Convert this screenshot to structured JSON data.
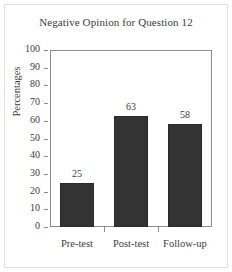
{
  "figure": {
    "background_color": "#ffffff",
    "frame_color": "#e3e3e3"
  },
  "chart_data": {
    "type": "bar",
    "title": "Negative Opinion for Question 12",
    "xlabel": "",
    "ylabel": "Percentages",
    "categories": [
      "Pre-test",
      "Post-test",
      "Follow-up"
    ],
    "values": [
      25,
      63,
      58
    ],
    "data_labels": [
      "25",
      "63",
      "58"
    ],
    "ylim": [
      0,
      100
    ],
    "ytick_step": 10,
    "yticks": [
      100,
      90,
      80,
      70,
      60,
      50,
      40,
      30,
      20,
      10,
      0
    ],
    "ytick_labels": [
      "100",
      "90",
      "80",
      "70",
      "60",
      "50",
      "40",
      "30",
      "20",
      "10",
      "0"
    ],
    "grid": false,
    "legend": null,
    "bar_color": "#333333",
    "axis_color": "#8d8d8d",
    "text_color": "#3b3b3b"
  }
}
